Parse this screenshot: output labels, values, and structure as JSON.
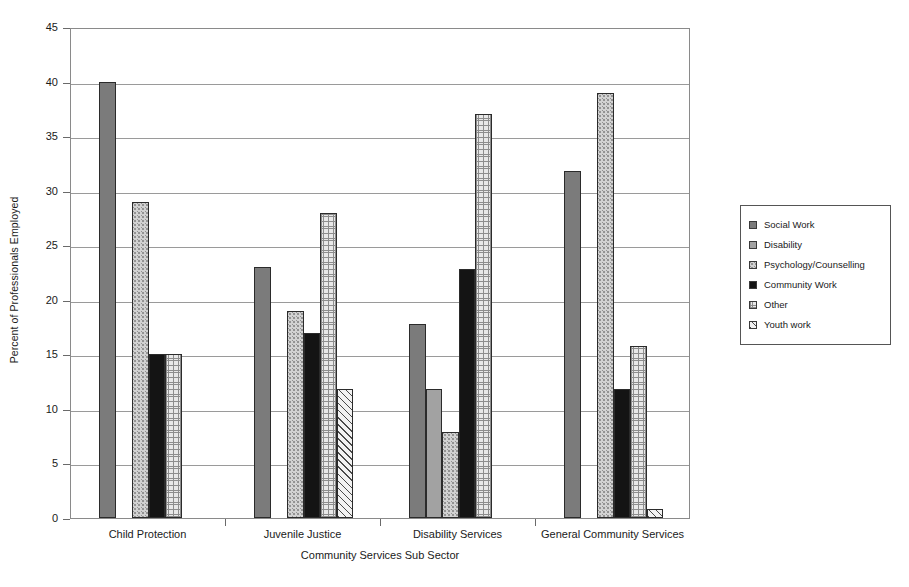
{
  "chart_data": {
    "type": "bar",
    "title": "",
    "xlabel": "Community Services Sub Sector",
    "ylabel": "Percent of Professionals Employed",
    "ylim": [
      0,
      45
    ],
    "yticks": [
      0,
      5,
      10,
      15,
      20,
      25,
      30,
      35,
      40,
      45
    ],
    "grid": true,
    "legend_position": "right",
    "categories": [
      "Child Protection",
      "Juvenile Justice",
      "Disability Services",
      "General Community Services"
    ],
    "series": [
      {
        "name": "Social Work",
        "pattern": "solid-dark-gray",
        "color": "#7b7b7b",
        "values": [
          40,
          23,
          17.8,
          31.8
        ]
      },
      {
        "name": "Disability",
        "pattern": "solid-mid-gray",
        "color": "#a2a2a2",
        "values": [
          null,
          null,
          11.8,
          null
        ]
      },
      {
        "name": "Psychology/Counselling",
        "pattern": "stipple-light",
        "color": "#d2d2d2",
        "values": [
          29,
          19,
          7.9,
          39
        ]
      },
      {
        "name": "Community Work",
        "pattern": "solid-black",
        "color": "#141414",
        "values": [
          15,
          17,
          22.8,
          11.8
        ]
      },
      {
        "name": "Other",
        "pattern": "fine-grid",
        "color": "#e8e8e8",
        "values": [
          15,
          28,
          37,
          15.8
        ]
      },
      {
        "name": "Youth work",
        "pattern": "diagonal-hatch",
        "color": "#f2f2f2",
        "values": [
          null,
          11.8,
          null,
          0.8
        ]
      }
    ]
  },
  "legend": {
    "items": [
      {
        "label": "Social Work"
      },
      {
        "label": "Disability"
      },
      {
        "label": "Psychology/Counselling"
      },
      {
        "label": "Community Work"
      },
      {
        "label": "Other"
      },
      {
        "label": "Youth work"
      }
    ]
  },
  "axes": {
    "y_title": "Percent of Professionals Employed",
    "x_title": "Community Services Sub Sector"
  }
}
